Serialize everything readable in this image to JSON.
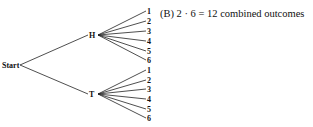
{
  "diagram": {
    "type": "tree",
    "root": {
      "label": "Start",
      "x": 19,
      "y": 65
    },
    "level1": [
      {
        "label": "H",
        "x": 97,
        "y": 35,
        "children": [
          {
            "label": "1",
            "y": 11
          },
          {
            "label": "2",
            "y": 21
          },
          {
            "label": "3",
            "y": 31
          },
          {
            "label": "4",
            "y": 41
          },
          {
            "label": "5",
            "y": 51
          },
          {
            "label": "6",
            "y": 60
          }
        ]
      },
      {
        "label": "T",
        "x": 97,
        "y": 94,
        "children": [
          {
            "label": "1",
            "y": 70
          },
          {
            "label": "2",
            "y": 80
          },
          {
            "label": "3",
            "y": 89
          },
          {
            "label": "4",
            "y": 99
          },
          {
            "label": "5",
            "y": 109
          },
          {
            "label": "6",
            "y": 118
          }
        ]
      }
    ],
    "leaf_x": 146,
    "caption": "(B) 2 · 6 = 12 combined outcomes"
  }
}
